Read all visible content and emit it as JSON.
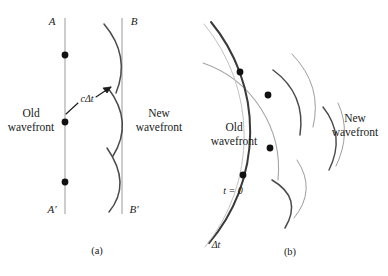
{
  "figure": {
    "kind": "physics-diagram",
    "width": 388,
    "height": 276,
    "background_color": "#ffffff",
    "ink_color": "#2b2b2b",
    "light_ink_color": "#8f8f8f",
    "text_color": "#1a1a1a"
  },
  "panel_a": {
    "caption": "(a)",
    "label_top_left": "A",
    "label_top_right": "B",
    "label_bottom_left": "A′",
    "label_bottom_right": "B′",
    "old_wavefront_label_line1": "Old",
    "old_wavefront_label_line2": "wavefront",
    "new_wavefront_label_line1": "New",
    "new_wavefront_label_line2": "wavefront",
    "radius_annotation": "cΔt",
    "source_point_count": 3
  },
  "panel_b": {
    "caption": "(b)",
    "old_wavefront_label_line1": "Old",
    "old_wavefront_label_line2": "wavefront",
    "new_wavefront_label_line1": "New",
    "new_wavefront_label_line2": "wavefront",
    "time_initial_label": "t = 0",
    "time_elapsed_label": "Δt",
    "source_point_count": 2
  }
}
